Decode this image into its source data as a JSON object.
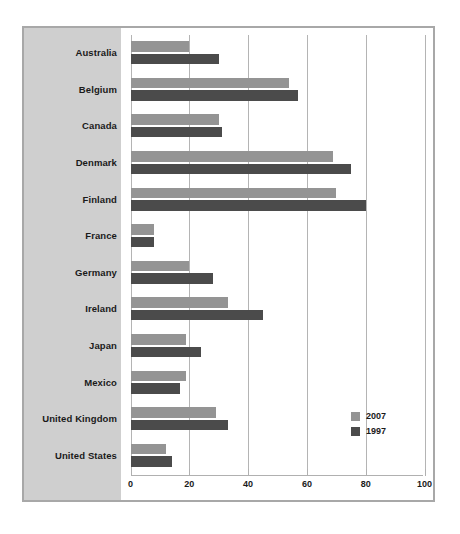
{
  "chart_data": {
    "type": "bar",
    "orientation": "horizontal",
    "title": "",
    "subtitle": "",
    "xlabel": "",
    "ylabel": "",
    "xlim": [
      0,
      100
    ],
    "xticks": [
      "0",
      "20",
      "40",
      "60",
      "80",
      "100"
    ],
    "xtick_values": [
      0,
      20,
      40,
      60,
      80,
      100
    ],
    "grid": true,
    "grid_axis": "x",
    "legend_position": "bottom-right",
    "categories": [
      "Australia",
      "Belgium",
      "Canada",
      "Denmark",
      "Finland",
      "France",
      "Germany",
      "Ireland",
      "Japan",
      "Mexico",
      "United Kingdom",
      "United States"
    ],
    "series": [
      {
        "name": "2007",
        "color": "#949494",
        "values": [
          20,
          54,
          30,
          69,
          70,
          8,
          20,
          33,
          19,
          19,
          29,
          12
        ]
      },
      {
        "name": "1997",
        "color": "#4b4b4b",
        "values": [
          30,
          57,
          31,
          75,
          80,
          8,
          28,
          45,
          24,
          17,
          33,
          14
        ]
      }
    ]
  },
  "legend": {
    "entries": [
      {
        "label": "2007",
        "color": "#949494"
      },
      {
        "label": "1997",
        "color": "#4b4b4b"
      }
    ]
  },
  "colors": {
    "frame_border": "#a8a8a8",
    "category_panel_bg": "#cfcfcf",
    "plot_bg": "#ffffff",
    "gridline": "#b4b4b4",
    "axis": "#b0b0b0",
    "text": "#1a1a1a",
    "series_2007": "#949494",
    "series_1997": "#4b4b4b"
  }
}
